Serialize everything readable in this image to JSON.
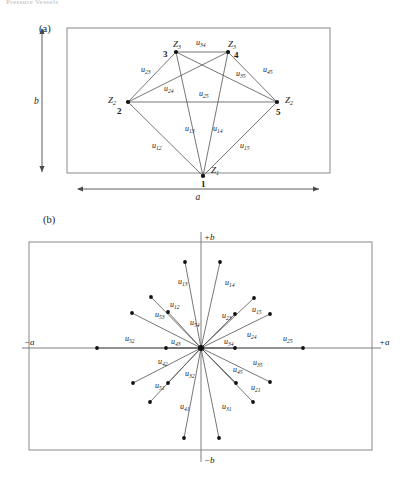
{
  "page": {
    "header_fragment": "Pressure Vessels",
    "width": 401,
    "height": 478,
    "stroke_color": "#4a4a4a",
    "node_color": "#111111",
    "frame_color": "#8a8a8a"
  },
  "panel_a": {
    "tag": "(a)",
    "dim_width_label": "a",
    "dim_height_label": "b",
    "frame": {
      "x": 67,
      "y": 28,
      "w": 263,
      "h": 145
    },
    "nodes": [
      {
        "id": "n1",
        "number": "1",
        "z_label": "Z",
        "z_sub": "1",
        "x": 203,
        "y": 176,
        "num_dx": -2,
        "num_dy": 11,
        "z_dx": 8,
        "z_dy": -3
      },
      {
        "id": "n2",
        "number": "2",
        "z_label": "Z",
        "z_sub": "2",
        "x": 128,
        "y": 102,
        "num_dx": -11,
        "num_dy": 12,
        "z_dx": -20,
        "z_dy": 1
      },
      {
        "id": "n3",
        "number": "3",
        "z_label": "Z",
        "z_sub": "3",
        "x": 176,
        "y": 52,
        "num_dx": -13,
        "num_dy": 5,
        "z_dx": -3,
        "z_dy": -5
      },
      {
        "id": "n4",
        "number": "4",
        "z_label": "Z",
        "z_sub": "3",
        "x": 228,
        "y": 52,
        "num_dx": 6,
        "num_dy": 6,
        "z_dx": 0,
        "z_dy": -5
      },
      {
        "id": "n5",
        "number": "5",
        "z_label": "Z",
        "z_sub": "2",
        "x": 277,
        "y": 102,
        "num_dx": -1,
        "num_dy": 13,
        "z_dx": 8,
        "z_dy": 1
      }
    ],
    "edges": [
      {
        "u": "u",
        "sub": "12",
        "from": "n1",
        "to": "n2",
        "lx": 152,
        "ly": 148
      },
      {
        "u": "u",
        "sub": "13",
        "from": "n1",
        "to": "n3",
        "lx": 185,
        "ly": 131
      },
      {
        "u": "u",
        "sub": "14",
        "from": "n1",
        "to": "n4",
        "lx": 213,
        "ly": 131
      },
      {
        "u": "u",
        "sub": "15",
        "from": "n1",
        "to": "n5",
        "lx": 240,
        "ly": 148
      },
      {
        "u": "u",
        "sub": "23",
        "from": "n2",
        "to": "n3",
        "lx": 141,
        "ly": 72
      },
      {
        "u": "u",
        "sub": "24",
        "from": "n2",
        "to": "n4",
        "lx": 164,
        "ly": 91
      },
      {
        "u": "u",
        "sub": "25",
        "from": "n2",
        "to": "n5",
        "lx": 199,
        "ly": 96
      },
      {
        "u": "u",
        "sub": "34",
        "from": "n3",
        "to": "n4",
        "lx": 196,
        "ly": 45
      },
      {
        "u": "u",
        "sub": "35",
        "from": "n3",
        "to": "n5",
        "lx": 236,
        "ly": 76
      },
      {
        "u": "u",
        "sub": "45",
        "from": "n4",
        "to": "n5",
        "lx": 263,
        "ly": 72
      }
    ]
  },
  "panel_b": {
    "tag": "(b)",
    "frame": {
      "x": 29,
      "y": 242,
      "w": 343,
      "h": 208
    },
    "origin": {
      "x": 201,
      "y": 348
    },
    "axis_labels": {
      "plus_b": "+b",
      "minus_b": "−b",
      "plus_a": "+a",
      "minus_a": "−a"
    },
    "axis_extent": {
      "x_min": 22,
      "x_max": 381,
      "y_min": 232,
      "y_max": 462
    },
    "vectors": [
      {
        "u": "u",
        "sub": "13",
        "ex": 185,
        "ly": 284,
        "ey": 262,
        "lx": 178
      },
      {
        "u": "u",
        "sub": "14",
        "ex": 220,
        "ey": 262,
        "lx": 225,
        "ly": 285
      },
      {
        "u": "u",
        "sub": "12",
        "ex": 151,
        "ey": 297,
        "lx": 170,
        "ly": 307
      },
      {
        "u": "u",
        "sub": "15",
        "ex": 254,
        "ey": 298,
        "lx": 252,
        "ly": 312
      },
      {
        "u": "u",
        "sub": "53",
        "ex": 132,
        "ey": 313,
        "lx": 155,
        "ly": 317
      },
      {
        "u": "u",
        "sub": "54",
        "ex": 168,
        "ey": 312,
        "lx": 190,
        "ly": 325
      },
      {
        "u": "u",
        "sub": "23",
        "ex": 235,
        "ey": 314,
        "lx": 222,
        "ly": 318
      },
      {
        "u": "u",
        "sub": "24",
        "ex": 270,
        "ey": 314,
        "lx": 247,
        "ly": 337
      },
      {
        "u": "u",
        "sub": "52",
        "ex": 97,
        "ey": 348,
        "lx": 125,
        "ly": 341
      },
      {
        "u": "u",
        "sub": "43",
        "ex": 166,
        "ey": 348,
        "lx": 171,
        "ly": 344
      },
      {
        "u": "u",
        "sub": "34",
        "ex": 235,
        "ey": 348,
        "lx": 224,
        "ly": 344
      },
      {
        "u": "u",
        "sub": "25",
        "ex": 303,
        "ey": 348,
        "lx": 283,
        "ly": 341
      },
      {
        "u": "u",
        "sub": "42",
        "ex": 133,
        "ey": 383,
        "lx": 158,
        "ly": 364
      },
      {
        "u": "u",
        "sub": "35",
        "ex": 270,
        "ey": 382,
        "lx": 253,
        "ly": 365
      },
      {
        "u": "u",
        "sub": "51",
        "ex": 150,
        "ey": 402,
        "lx": 155,
        "ly": 388
      },
      {
        "u": "u",
        "sub": "32",
        "ex": 168,
        "ey": 383,
        "lx": 185,
        "ly": 376
      },
      {
        "u": "u",
        "sub": "45",
        "ex": 236,
        "ey": 383,
        "lx": 233,
        "ly": 372
      },
      {
        "u": "u",
        "sub": "21",
        "ex": 253,
        "ey": 402,
        "lx": 251,
        "ly": 390
      },
      {
        "u": "u",
        "sub": "41",
        "ex": 184,
        "ey": 438,
        "lx": 180,
        "ly": 409
      },
      {
        "u": "u",
        "sub": "31",
        "ex": 219,
        "ey": 438,
        "lx": 222,
        "ly": 409
      }
    ]
  }
}
